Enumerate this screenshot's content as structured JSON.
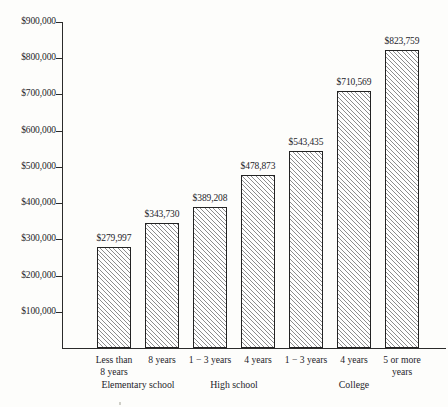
{
  "chart_data": {
    "type": "bar",
    "title": "",
    "xlabel": "",
    "ylabel": "",
    "ylim": [
      0,
      900000
    ],
    "grid": false,
    "legend": "none",
    "ytick_labels": [
      "$900,000",
      "$800,000",
      "$700,000",
      "$600,000",
      "$500,000",
      "$400,000",
      "$300,000",
      "$200,000",
      "$100,000"
    ],
    "ytick_values": [
      900000,
      800000,
      700000,
      600000,
      500000,
      400000,
      300000,
      200000,
      100000
    ],
    "categories": [
      "Less than 8 years",
      "8 years",
      "1 − 3 years",
      "4 years",
      "1 − 3 years",
      "4 years",
      "5 or more years"
    ],
    "values": [
      279997,
      343730,
      389208,
      478873,
      543435,
      710569,
      823759
    ],
    "data_labels": [
      "$279,997",
      "$343,730",
      "$389,208",
      "$478,873",
      "$543,435",
      "$710,569",
      "$823,759"
    ],
    "bars": [
      {
        "label_line1": "Less than",
        "label_line2": "8 years",
        "value": 279997,
        "data_label": "$279,997",
        "group": "Elementary school"
      },
      {
        "label_line1": "8 years",
        "label_line2": "",
        "value": 343730,
        "data_label": "$343,730",
        "group": "Elementary school"
      },
      {
        "label_line1": "1 − 3 years",
        "label_line2": "",
        "value": 389208,
        "data_label": "$389,208",
        "group": "High school"
      },
      {
        "label_line1": "4 years",
        "label_line2": "",
        "value": 478873,
        "data_label": "$478,873",
        "group": "High school"
      },
      {
        "label_line1": "1 − 3 years",
        "label_line2": "",
        "value": 543435,
        "data_label": "$543,435",
        "group": "College"
      },
      {
        "label_line1": "4 years",
        "label_line2": "",
        "value": 710569,
        "data_label": "$710,569",
        "group": "College"
      },
      {
        "label_line1": "5 or more",
        "label_line2": "years",
        "value": 823759,
        "data_label": "$823,759",
        "group": "College"
      }
    ],
    "groups": [
      {
        "label": "Elementary school",
        "bar_indices": [
          0,
          1
        ]
      },
      {
        "label": "High school",
        "bar_indices": [
          2,
          3
        ]
      },
      {
        "label": "College",
        "bar_indices": [
          4,
          5,
          6
        ]
      }
    ],
    "colors": {
      "background": "#fdfdfb",
      "axis": "#2b2b2b",
      "bar_border": "#232323",
      "bar_fill": "#ffffff",
      "bar_hatch": "#8d8d8d",
      "text": "#24242a"
    }
  }
}
